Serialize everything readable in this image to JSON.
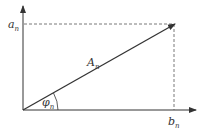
{
  "diagram": {
    "type": "phasor-vector",
    "labels": {
      "y_component": "a",
      "y_sub": "n",
      "x_component": "b",
      "x_sub": "n",
      "vector": "A",
      "vector_sub": "n",
      "angle": "φ",
      "angle_sub": "n"
    },
    "colors": {
      "line": "#333333",
      "dashed": "#555555"
    }
  }
}
